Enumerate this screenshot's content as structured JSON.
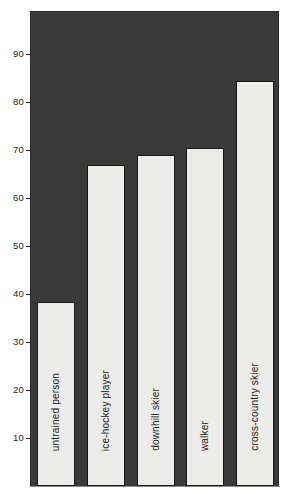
{
  "chart_data": {
    "type": "bar",
    "title": "",
    "subtitle": "",
    "xlabel": "",
    "ylabel": "",
    "categories": [
      "untrained person",
      "ice-hockey player",
      "downhill skier",
      "walker",
      "cross-country skier"
    ],
    "values": [
      38,
      66.5,
      68.5,
      70,
      84
    ],
    "ylim": [
      0,
      99
    ],
    "yticks": [
      10,
      20,
      30,
      40,
      50,
      60,
      70,
      80,
      90
    ],
    "ytick_labels": [
      "10",
      "20",
      "30",
      "40",
      "50",
      "60",
      "70",
      "80",
      "90"
    ],
    "grid": false,
    "legend": null,
    "colors": {
      "plot_background": "#3a3a3a",
      "bar_fill": "#ececea",
      "bar_edge": "#17171a",
      "text": "#1a1a1a",
      "page_background": "#ffffff"
    }
  }
}
